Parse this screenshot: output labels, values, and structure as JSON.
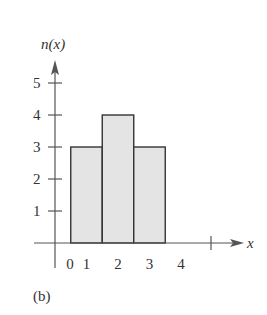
{
  "chart_data": {
    "type": "bar",
    "title": "",
    "xlabel": "x",
    "ylabel": "n(x)",
    "categories": [
      "1",
      "2",
      "3"
    ],
    "x": [
      1,
      2,
      3
    ],
    "values": [
      3,
      4,
      3
    ],
    "bar_width": 1,
    "x_ticks": [
      "0",
      "1",
      "2",
      "3",
      "4"
    ],
    "y_ticks": [
      "1",
      "2",
      "3",
      "4",
      "5"
    ],
    "xlim": [
      0,
      4.5
    ],
    "ylim": [
      0,
      5.5
    ],
    "grid": false,
    "legend": null,
    "colors": {
      "bar_fill": "#e4e4e4",
      "bar_stroke": "#333333",
      "axis": "#555555"
    }
  },
  "caption": "(b)"
}
